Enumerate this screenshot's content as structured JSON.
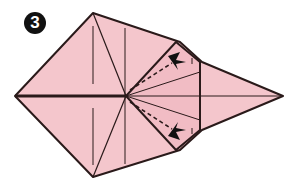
{
  "step": {
    "number": "3"
  },
  "colors": {
    "paper": "#f4c6cc",
    "line": "#2a1a1a",
    "background": "#ffffff"
  },
  "diagram": {
    "arrows": [
      {
        "name": "upper-fold-arrow"
      },
      {
        "name": "lower-fold-arrow"
      }
    ]
  }
}
